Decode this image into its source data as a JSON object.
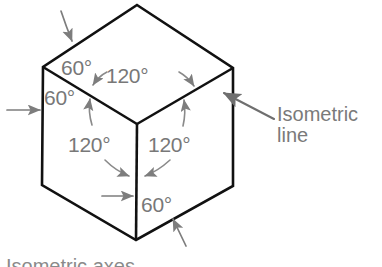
{
  "figure": {
    "shape": "cube-isometric-hexagon",
    "line_color": "#111111",
    "annotation_color": "#787878",
    "background": "#ffffff",
    "callout": {
      "line1": "Isometric",
      "line2": "line"
    },
    "angle_labels": [
      {
        "name": "top-left-60",
        "text": "60°",
        "x": 61,
        "y": 57
      },
      {
        "name": "top-120",
        "text": "120°",
        "x": 106,
        "y": 65
      },
      {
        "name": "left-60",
        "text": "60°",
        "x": 44,
        "y": 87
      },
      {
        "name": "lower-left-120",
        "text": "120°",
        "x": 68,
        "y": 134
      },
      {
        "name": "lower-right-120",
        "text": "120°",
        "x": 148,
        "y": 134
      },
      {
        "name": "bottom-60",
        "text": "60°",
        "x": 141,
        "y": 194
      }
    ],
    "clipped_caption": "Isometric axes",
    "vertices": {
      "top": [
        137,
        5
      ],
      "upper_left": [
        43,
        67
      ],
      "upper_right": [
        233,
        68
      ],
      "center": [
        137,
        124
      ],
      "lower_left": [
        42,
        185
      ],
      "lower_right": [
        233,
        186
      ],
      "bottom": [
        136,
        240
      ]
    }
  }
}
